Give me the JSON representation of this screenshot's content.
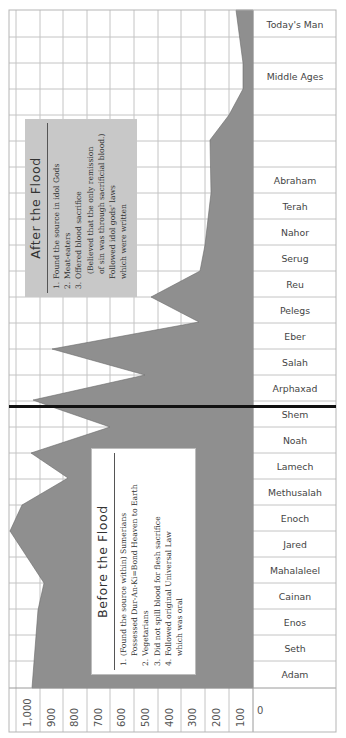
{
  "chart_data": {
    "type": "area",
    "orientation": "rotated-90",
    "title": "",
    "xlabel": "",
    "ylabel": "Lifespan (years)",
    "ylim": [
      0,
      1000
    ],
    "value_ticks": [
      "1,000",
      "900",
      "800",
      "700",
      "600",
      "500",
      "400",
      "300",
      "200",
      "100",
      "0"
    ],
    "grid": true,
    "categories": [
      "Adam",
      "Seth",
      "Enos",
      "Cainan",
      "Mahalaleel",
      "Jared",
      "Enoch",
      "Methusalah",
      "Lamech",
      "Noah",
      "Shem",
      "Arphaxad",
      "Salah",
      "Eber",
      "Pelegs",
      "Reu",
      "Serug",
      "Nahor",
      "Terah",
      "Abraham",
      "",
      "",
      "Middle Ages",
      "",
      "Today's Man"
    ],
    "series": [
      {
        "name": "Lifespan",
        "color": "#8f8f8f",
        "values": [
          930,
          912,
          905,
          910,
          895,
          962,
          365,
          969,
          777,
          950,
          600,
          438,
          433,
          464,
          239,
          239,
          230,
          148,
          205,
          175,
          180,
          100,
          45,
          45,
          70
        ]
      }
    ],
    "divider": {
      "between": [
        "Arphaxad",
        "Shem"
      ],
      "label": "Flood"
    },
    "annotations": [
      {
        "title": "After the Flood",
        "items": [
          "1. Found the source in idol Gods",
          "2. Meat-eaters",
          "3. Offered blood sacrifice",
          "(Believed that the only remission",
          "of sin was through sacrificial blood.)",
          "Followed idol gods' laws",
          "which were written"
        ]
      },
      {
        "title": "Before the Flood",
        "items": [
          "1. (Found the source within) Sumerians",
          "Possessed Dur-An-Ki=Bond Heaven to Earth",
          "2. Vegetarians",
          "3. Did not spill blood for flesh sacrifice",
          "4. Followed original Universal Law",
          "which was oral"
        ]
      }
    ]
  },
  "rows": [
    {
      "label": "Today's Man",
      "cy": 24
    },
    {
      "label": "",
      "cy": 50
    },
    {
      "label": "Middle Ages",
      "cy": 76
    },
    {
      "label": "",
      "cy": 102
    },
    {
      "label": "",
      "cy": 128
    },
    {
      "label": "",
      "cy": 154
    },
    {
      "label": "Abraham",
      "cy": 180
    },
    {
      "label": "Terah",
      "cy": 206
    },
    {
      "label": "Nahor",
      "cy": 232
    },
    {
      "label": "Serug",
      "cy": 258
    },
    {
      "label": "Reu",
      "cy": 284
    },
    {
      "label": "Pelegs",
      "cy": 310
    },
    {
      "label": "Eber",
      "cy": 336
    },
    {
      "label": "Salah",
      "cy": 362
    },
    {
      "label": "Arphaxad",
      "cy": 388
    },
    {
      "label": "Shem",
      "cy": 414
    },
    {
      "label": "Noah",
      "cy": 440
    },
    {
      "label": "Lamech",
      "cy": 466
    },
    {
      "label": "Methusalah",
      "cy": 492
    },
    {
      "label": "Enoch",
      "cy": 518
    },
    {
      "label": "Jared",
      "cy": 544
    },
    {
      "label": "Mahalaleel",
      "cy": 570
    },
    {
      "label": "Cainan",
      "cy": 596
    },
    {
      "label": "Enos",
      "cy": 622
    },
    {
      "label": "Seth",
      "cy": 648
    },
    {
      "label": "Adam",
      "cy": 674
    }
  ],
  "axis": {
    "ticks": [
      {
        "label": "1,000",
        "x": 16
      },
      {
        "label": "900",
        "x": 40
      },
      {
        "label": "800",
        "x": 63
      },
      {
        "label": "700",
        "x": 87
      },
      {
        "label": "600",
        "x": 110
      },
      {
        "label": "500",
        "x": 134
      },
      {
        "label": "400",
        "x": 158
      },
      {
        "label": "300",
        "x": 181
      },
      {
        "label": "200",
        "x": 205
      },
      {
        "label": "100",
        "x": 229
      }
    ],
    "zero_label": "0"
  },
  "after_box": {
    "title": "After the Flood",
    "lines": [
      {
        "num": "1.",
        "text": "Found the source in idol Gods"
      },
      {
        "num": "2.",
        "text": "Meat-eaters"
      },
      {
        "num": "3.",
        "text": "Offered blood sacrifice"
      },
      {
        "num": "",
        "text": "(Believed that the only remission"
      },
      {
        "num": "",
        "text": "of sin was through sacrificial blood.)"
      },
      {
        "num": "",
        "text": "Followed idol gods' laws"
      },
      {
        "num": "",
        "text": "which were written"
      }
    ]
  },
  "before_box": {
    "title": "Before the Flood",
    "lines": [
      {
        "num": "1.",
        "text": "(Found the source within) Sumerians"
      },
      {
        "num": "",
        "text": "Possessed Dur-An-Ki=Bond Heaven to Earth"
      },
      {
        "num": "2.",
        "text": "Vegetarians"
      },
      {
        "num": "3.",
        "text": "Did not spill blood for flesh sacrifice"
      },
      {
        "num": "4.",
        "text": "Followed original Universal Law"
      },
      {
        "num": "",
        "text": "which was oral"
      }
    ]
  },
  "colors": {
    "fill": "#8f8f8f",
    "grid": "#bcbcbc",
    "after_box": "#c8c8c8",
    "divider": "#111111",
    "text": "#333333"
  }
}
